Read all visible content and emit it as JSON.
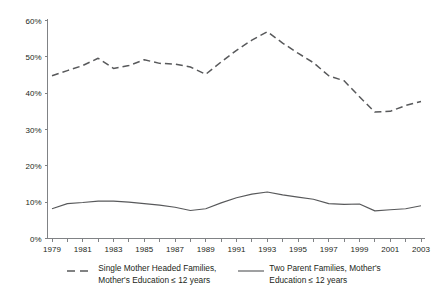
{
  "chart_data": {
    "type": "line",
    "title": "",
    "xlabel": "",
    "ylabel": "",
    "ylim": [
      0,
      60
    ],
    "yunit": "%",
    "grid": false,
    "legend_position": "bottom",
    "y_ticks": [
      "0%",
      "10%",
      "20%",
      "30%",
      "40%",
      "50%",
      "60%"
    ],
    "y_tick_values": [
      0,
      10,
      20,
      30,
      40,
      50,
      60
    ],
    "x": [
      1979,
      1980,
      1981,
      1982,
      1983,
      1984,
      1985,
      1986,
      1987,
      1988,
      1989,
      1990,
      1991,
      1992,
      1993,
      1994,
      1995,
      1996,
      1997,
      1998,
      1999,
      2000,
      2001,
      2002,
      2003
    ],
    "x_tick_labels": [
      "1979",
      "1981",
      "1983",
      "1985",
      "1987",
      "1989",
      "1991",
      "1993",
      "1995",
      "1997",
      "1999",
      "2001",
      "2003"
    ],
    "x_tick_values": [
      1979,
      1981,
      1983,
      1985,
      1987,
      1989,
      1991,
      1993,
      1995,
      1997,
      1999,
      2001,
      2003
    ],
    "series": [
      {
        "name": "Single Mother Headed Families, Mother's Education ≤ 12 years",
        "style": "dashed",
        "color": "#58595b",
        "values": [
          44.8,
          46.2,
          47.6,
          49.6,
          46.8,
          47.6,
          49.2,
          48.2,
          48.0,
          47.2,
          45.2,
          48.6,
          51.8,
          54.6,
          56.9,
          53.8,
          51.0,
          48.4,
          44.8,
          43.4,
          39.0,
          34.8,
          35.0,
          36.6,
          37.7
        ]
      },
      {
        "name": "Two Parent Families, Mother's Education ≤ 12 years",
        "style": "solid",
        "color": "#58595b",
        "values": [
          8.2,
          9.6,
          9.9,
          10.3,
          10.3,
          10.0,
          9.6,
          9.2,
          8.6,
          7.7,
          8.2,
          9.8,
          11.2,
          12.2,
          12.8,
          12.0,
          11.4,
          10.8,
          9.6,
          9.4,
          9.5,
          7.6,
          7.9,
          8.2,
          9.0
        ]
      }
    ]
  },
  "legend": {
    "items": [
      {
        "label": "Single Mother Headed Families,\nMother's Education ≤ 12 years",
        "swatch": "dashed-line-swatch"
      },
      {
        "label": "Two Parent Families, Mother's\nEducation ≤ 12 years",
        "swatch": "solid-line-swatch"
      }
    ]
  },
  "colors": {
    "line": "#58595b",
    "axis": "#808285",
    "text": "#231f20",
    "background": "#ffffff"
  }
}
